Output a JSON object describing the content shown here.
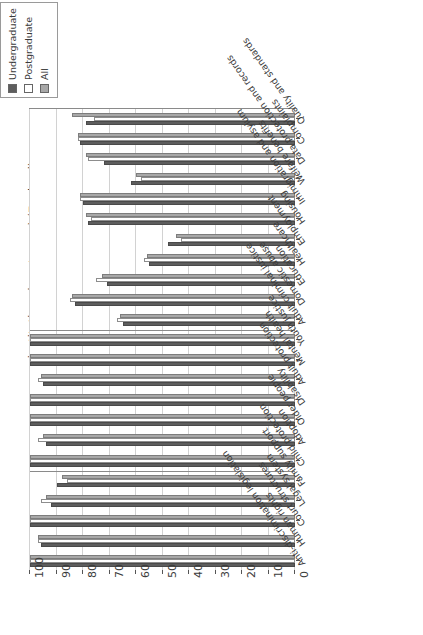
{
  "chart_data": {
    "type": "bar",
    "orientation": "horizontal",
    "title": "",
    "xlabel": "",
    "ylabel": "institutions in category) (England)",
    "ylim": [
      0,
      100
    ],
    "grid": true,
    "legend_position": "top-left",
    "tick_labels": [
      "100",
      "90",
      "80",
      "70",
      "60",
      "50",
      "40",
      "30",
      "20",
      "10",
      "0"
    ],
    "tick_values": [
      100,
      90,
      80,
      70,
      60,
      50,
      40,
      30,
      20,
      10,
      0
    ],
    "axis_direction": "zero-at-right",
    "block_breaks": [
      11,
      18
    ],
    "categories": [
      "Quality and standards",
      "Complaints",
      "Data protection and records",
      "Welfare benefits",
      "Immigration and asylum",
      "Housing",
      "Employment",
      "Healthcare",
      "Education",
      "Domestic abuse",
      "Adult criminal justice",
      "Youth justice",
      "Mental health",
      "Adult protection",
      "Disability",
      "Older people",
      "Adoption",
      "Child protection",
      "Family support",
      "Legal system",
      "Court structures",
      "Human rights",
      "Anti-discrimination legislation"
    ],
    "series": [
      {
        "name": "Undergraduate",
        "color": "#5d5d5d",
        "values": [
          79,
          81,
          72,
          62,
          80,
          78,
          48,
          55,
          71,
          83,
          65,
          100,
          100,
          95,
          100,
          100,
          94,
          100,
          90,
          92,
          100,
          96,
          100
        ]
      },
      {
        "name": "Postgraduate",
        "color": "#ffffff",
        "values": [
          76,
          82,
          78,
          58,
          81,
          77,
          43,
          57,
          75,
          85,
          67,
          100,
          100,
          97,
          100,
          100,
          97,
          100,
          86,
          96,
          100,
          97,
          100
        ]
      },
      {
        "name": "All",
        "color": "#a8a8a8",
        "values": [
          84,
          82,
          79,
          60,
          81,
          79,
          45,
          56,
          73,
          84,
          66,
          100,
          100,
          96,
          100,
          100,
          95,
          100,
          88,
          94,
          100,
          97,
          100
        ]
      }
    ]
  }
}
